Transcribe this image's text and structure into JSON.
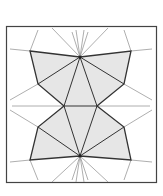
{
  "diagram": {
    "type": "geometric-tessellation",
    "colors": {
      "frame": "#444444",
      "fill": "#e6e6e6",
      "edge": "#333333",
      "ray": "#999999"
    },
    "frame": {
      "x": 6,
      "y": 26,
      "w": 151,
      "h": 157
    },
    "points": {
      "top_apex": [
        80,
        57
      ],
      "bot_apex": [
        80,
        156
      ],
      "tl": [
        30,
        51
      ],
      "tr": [
        131,
        51
      ],
      "bl": [
        30,
        160
      ],
      "br": [
        131,
        160
      ],
      "ml_up": [
        38,
        84
      ],
      "mr_up": [
        124,
        84
      ],
      "ml_lo": [
        38,
        127
      ],
      "mr_lo": [
        124,
        127
      ],
      "cl": [
        64,
        106
      ],
      "cr": [
        97,
        106
      ]
    }
  }
}
